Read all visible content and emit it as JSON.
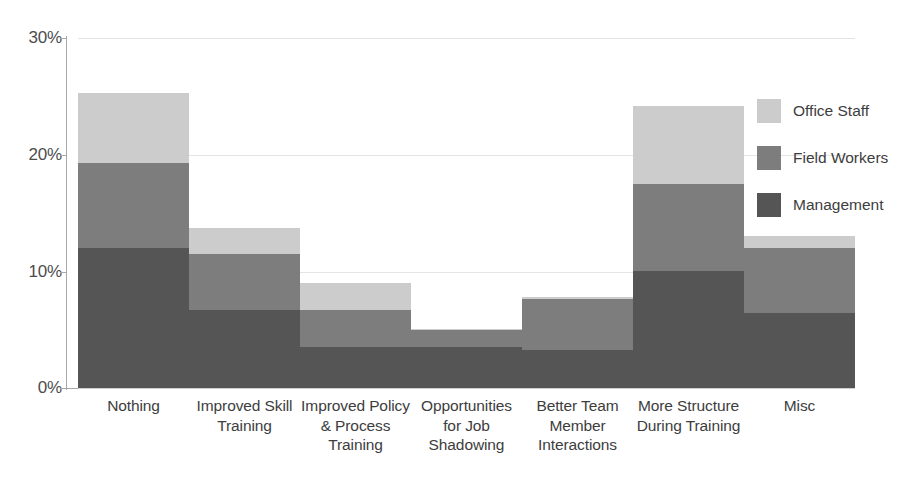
{
  "chart_data": {
    "type": "bar",
    "subtype": "stacked-bar",
    "title": "",
    "xlabel": "",
    "ylabel": "",
    "ylim": [
      0,
      30
    ],
    "yticks": [
      0,
      10,
      20,
      30
    ],
    "ytick_labels": [
      "0%",
      "10%",
      "20%",
      "30%"
    ],
    "grid": true,
    "legend_position": "right",
    "categories": [
      "Nothing",
      "Improved Skill Training",
      "Improved Policy & Process Training",
      "Opportunities for Job Shadowing",
      "Better Team Member Interactions",
      "More Structure During Training",
      "Misc"
    ],
    "series": [
      {
        "name": "Management",
        "color": "#555555",
        "values": [
          12.0,
          6.7,
          3.5,
          3.5,
          3.3,
          10.0,
          6.4
        ]
      },
      {
        "name": "Field Workers",
        "color": "#7d7d7d",
        "values": [
          7.3,
          4.8,
          3.2,
          1.5,
          4.3,
          7.5,
          5.6
        ]
      },
      {
        "name": "Office Staff",
        "color": "#cccccc",
        "values": [
          6.0,
          2.2,
          2.3,
          0.1,
          0.2,
          6.7,
          1.0
        ]
      }
    ],
    "totals": [
      25.3,
      13.7,
      9.0,
      5.1,
      7.8,
      24.2,
      13.0
    ]
  },
  "legend": {
    "items": [
      {
        "label": "Office Staff",
        "swatch": "office"
      },
      {
        "label": "Field Workers",
        "swatch": "field"
      },
      {
        "label": "Management",
        "swatch": "mgmt"
      }
    ]
  }
}
